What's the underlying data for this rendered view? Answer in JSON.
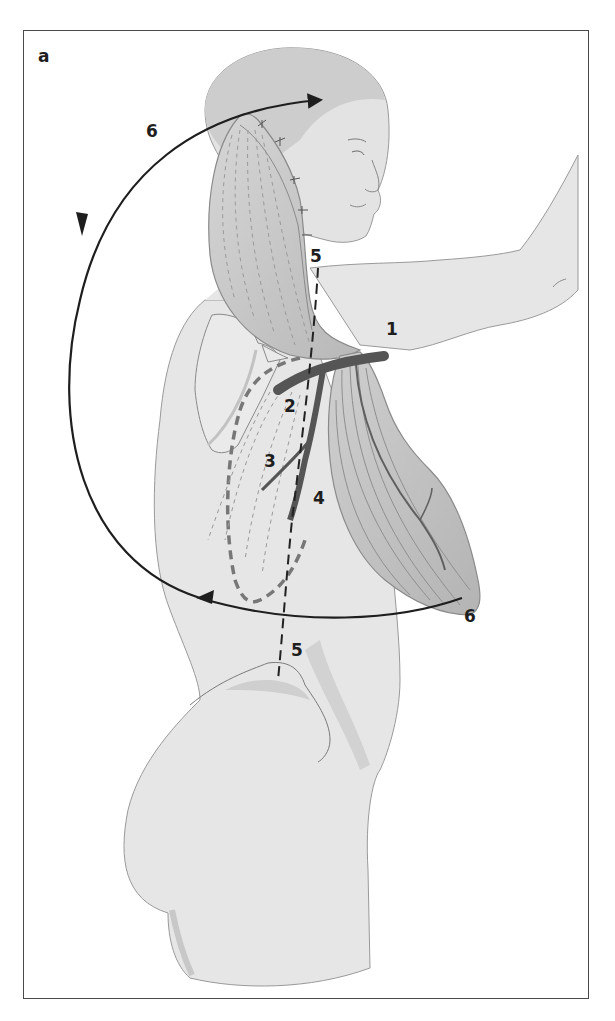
{
  "figure": {
    "panel_label": "a",
    "labels": [
      {
        "id": "1",
        "text": "1",
        "x": 386,
        "y": 335
      },
      {
        "id": "2",
        "text": "2",
        "x": 284,
        "y": 412
      },
      {
        "id": "3",
        "text": "3",
        "x": 264,
        "y": 467
      },
      {
        "id": "4",
        "text": "4",
        "x": 313,
        "y": 504
      },
      {
        "id": "5a",
        "text": "5",
        "x": 310,
        "y": 262
      },
      {
        "id": "5b",
        "text": "5",
        "x": 291,
        "y": 656
      },
      {
        "id": "6a",
        "text": "6",
        "x": 146,
        "y": 137
      },
      {
        "id": "6b",
        "text": "6",
        "x": 464,
        "y": 622
      }
    ],
    "colors": {
      "skin": "#e6e6e6",
      "muscle": "#c4c4c4",
      "muscle_dark": "#a9a9a9",
      "vessel": "#555555",
      "outline": "#8a8a8a",
      "arrow": "#1e1e1e",
      "frame": "#4a4a4a"
    }
  }
}
